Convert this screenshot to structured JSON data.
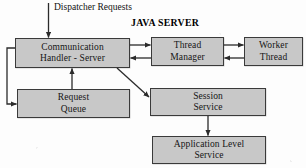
{
  "diagram": {
    "title": "JAVA SERVER",
    "external_label": {
      "line1": "Dispatcher",
      "line2": "Requests"
    },
    "nodes": [
      {
        "id": "communication-handler-server",
        "line1": "Communication",
        "line2": "Handler - Server",
        "x": 15,
        "y": 38,
        "w": 115,
        "h": 30
      },
      {
        "id": "thread-manager",
        "line1": "Thread",
        "line2": "Manager",
        "x": 151,
        "y": 37,
        "w": 73,
        "h": 29
      },
      {
        "id": "worker-thread",
        "line1": "Worker",
        "line2": "Thread",
        "x": 244,
        "y": 37,
        "w": 59,
        "h": 29
      },
      {
        "id": "request-queue",
        "line1": "Request",
        "line2": "Queue",
        "x": 17,
        "y": 89,
        "w": 113,
        "h": 29
      },
      {
        "id": "session-service",
        "line1": "Session",
        "line2": "Service",
        "x": 150,
        "y": 88,
        "w": 116,
        "h": 28
      },
      {
        "id": "application-level-service",
        "line1": "Application Level",
        "line2": "Service",
        "x": 152,
        "y": 136,
        "w": 114,
        "h": 28
      }
    ],
    "edges": [
      {
        "id": "dispatcher-to-communication-handler",
        "from": "dispatcher-requests",
        "to": "communication-handler-server"
      },
      {
        "id": "communication-handler-to-thread-manager",
        "from": "communication-handler-server",
        "to": "thread-manager"
      },
      {
        "id": "thread-manager-to-communication-handler",
        "from": "thread-manager",
        "to": "communication-handler-server"
      },
      {
        "id": "thread-manager-to-worker-thread",
        "from": "thread-manager",
        "to": "worker-thread"
      },
      {
        "id": "worker-thread-to-thread-manager",
        "from": "worker-thread",
        "to": "thread-manager"
      },
      {
        "id": "communication-handler-to-request-queue",
        "from": "communication-handler-server",
        "to": "request-queue"
      },
      {
        "id": "request-queue-to-communication-handler",
        "from": "request-queue",
        "to": "communication-handler-server"
      },
      {
        "id": "communication-handler-to-session-service",
        "from": "communication-handler-server",
        "to": "session-service"
      },
      {
        "id": "session-service-to-application-level-service",
        "from": "session-service",
        "to": "application-level-service"
      }
    ],
    "colors": {
      "node_fill": "#c8c8c8",
      "node_border": "#3a3a3a",
      "line": "#2b2b2b",
      "text": "#151515",
      "background": "#fdfdfd"
    }
  }
}
